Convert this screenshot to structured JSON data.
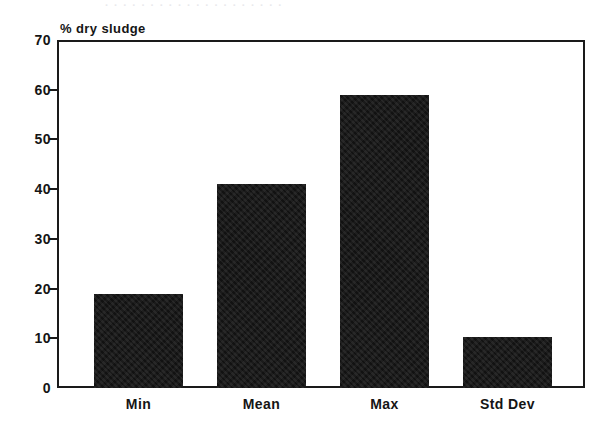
{
  "figure": {
    "clipped_top_line": "· · · · · · · · · · · · · · · · · · · ·",
    "axis_title": "% dry sludge"
  },
  "chart_data": {
    "type": "bar",
    "title": "",
    "subtitle": "",
    "xlabel": "",
    "ylabel": "% dry sludge",
    "categories": [
      "Min",
      "Mean",
      "Max",
      "Std Dev"
    ],
    "values": [
      19,
      41,
      59,
      10.2
    ],
    "series": [
      {
        "name": "% dry sludge",
        "values": [
          19,
          41,
          59,
          10.2
        ]
      }
    ],
    "ylim": [
      0,
      70
    ],
    "ytick_labels": [
      "0",
      "10",
      "20",
      "30",
      "40",
      "50",
      "60",
      "70"
    ],
    "ytick_values": [
      0,
      10,
      20,
      30,
      40,
      50,
      60,
      70
    ],
    "grid": "horizontal-dotted",
    "legend": "none",
    "bar_color": "#121212",
    "axis_color": "#1a1a1a",
    "grid_color": "#9a9a9a",
    "background": "#ffffff"
  }
}
